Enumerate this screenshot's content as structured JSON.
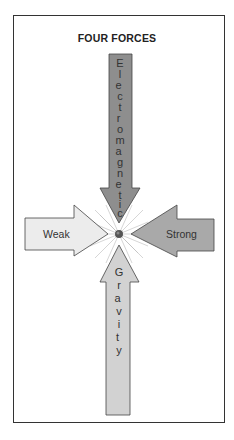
{
  "title": "FOUR FORCES",
  "forces": {
    "electromagnetic": {
      "label": "Electromagnetic",
      "direction": "down",
      "color": "#8e8e8e"
    },
    "weak": {
      "label": "Weak",
      "direction": "right",
      "color": "#ececec"
    },
    "strong": {
      "label": "Strong",
      "direction": "left",
      "color": "#a9a9a9"
    },
    "gravity": {
      "label": "Gravity",
      "direction": "up",
      "color": "#d2d2d2"
    }
  },
  "center": {
    "name": "interaction-point"
  }
}
